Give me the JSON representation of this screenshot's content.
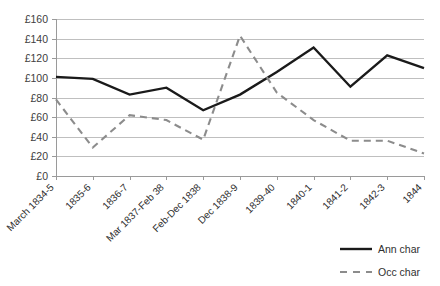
{
  "chart_data": {
    "type": "line",
    "title": "",
    "xlabel": "",
    "ylabel": "",
    "ylim": [
      0,
      160
    ],
    "ytick_step": 20,
    "grid": true,
    "legend_position": "bottom-right",
    "ytick_labels": [
      "£160",
      "£140",
      "£120",
      "£100",
      "£80",
      "£60",
      "£40",
      "£20",
      "£0"
    ],
    "yticks": [
      160,
      140,
      120,
      100,
      80,
      60,
      40,
      20,
      0
    ],
    "currency_symbol": "£",
    "categories": [
      "March 1834-5",
      "1835-6",
      "1836-7",
      "Mar 1837-Feb 38",
      "Feb-Dec 1838",
      "Dec 1838-9",
      "1839-40",
      "1840-1",
      "1841-2",
      "1842-3",
      "1844"
    ],
    "series": [
      {
        "name": "Ann char",
        "style": "solid",
        "color": "#1a1a1a",
        "values": [
          101,
          99,
          83,
          90,
          67,
          83,
          106,
          131,
          91,
          123,
          110
        ]
      },
      {
        "name": "Occ char",
        "style": "dashed",
        "color": "#8c8c8c",
        "values": [
          78,
          29,
          62,
          57,
          37,
          143,
          85,
          57,
          36,
          36,
          23
        ]
      }
    ],
    "legend": [
      {
        "label": "Ann char",
        "style": "solid",
        "color": "#1a1a1a"
      },
      {
        "label": "Occ char",
        "style": "dashed",
        "color": "#8c8c8c"
      }
    ]
  }
}
